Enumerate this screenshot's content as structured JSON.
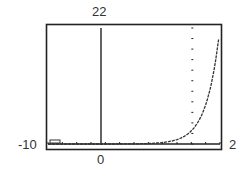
{
  "chart_data": {
    "type": "line",
    "title": "",
    "xlabel": "",
    "ylabel": "",
    "xlim": [
      -10,
      2
    ],
    "ylim": [
      0,
      22
    ],
    "x_tick_step": 1,
    "y_tick_step": 2,
    "grid": false,
    "legend": "none",
    "labels": {
      "ymax": "22",
      "xmin": "-10",
      "xmax": "2",
      "origin": "0"
    },
    "series": [
      {
        "name": "f(x)",
        "x": [
          -10,
          -8,
          -6,
          -4,
          -2,
          -1,
          0,
          0.5,
          1,
          1.5,
          2
        ],
        "values": [
          0.0,
          0.05,
          0.15,
          0.5,
          1.3,
          2.0,
          2.5,
          3.5,
          5.5,
          9.5,
          22
        ]
      }
    ]
  }
}
